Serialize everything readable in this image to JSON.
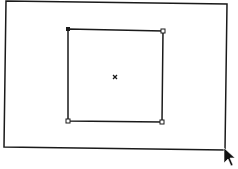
{
  "canvas": {
    "background": "#ffffff",
    "stroke_color": "#1a1a1a",
    "outer_frame": {
      "points": [
        [
          6,
          1
        ],
        [
          227,
          4
        ],
        [
          225,
          150
        ],
        [
          4,
          147
        ]
      ]
    },
    "selected_shape": {
      "type": "rectangle",
      "corners": {
        "top_left": [
          68,
          29
        ],
        "top_right": [
          163,
          31
        ],
        "bottom_right": [
          162,
          122
        ],
        "bottom_left": [
          68,
          121
        ]
      },
      "handles": 4,
      "center_marker": [
        115,
        77
      ]
    },
    "cursor": {
      "type": "arrow",
      "position": [
        224,
        150
      ]
    }
  }
}
